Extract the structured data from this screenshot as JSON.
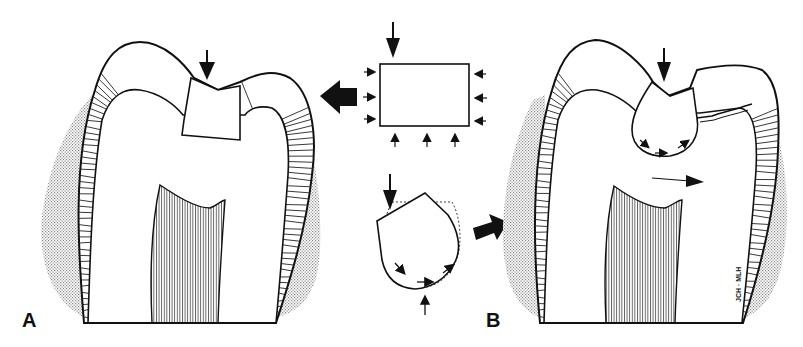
{
  "figure": {
    "panel_a": {
      "label": "A",
      "description": "Tooth cross-section with rectangular inlay under vertical load"
    },
    "panel_b": {
      "label": "B",
      "description": "Tooth cross-section with rounded restoration causing cusp fracture"
    },
    "center_top": {
      "description": "Rectangular block with uniform compressive forces"
    },
    "center_bottom": {
      "description": "Rounded teardrop block deforming under load (dotted original outline)"
    },
    "signature": "JCH · MLH"
  },
  "colors": {
    "ink": "#111111",
    "gum_stipple": "#9a9a9a",
    "background": "#ffffff"
  }
}
